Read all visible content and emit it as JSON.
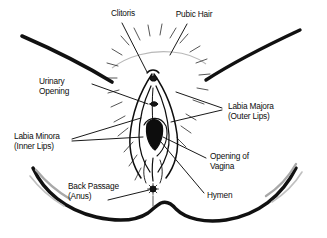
{
  "figure": {
    "kind": "anatomical-line-drawing",
    "style": "black ink line art with stippled pubic hair, white background",
    "ink_color": "#111111",
    "accent_gray": "#9a9a9a",
    "background_color": "#ffffff"
  },
  "labels": {
    "clitoris": {
      "line1": "Clitoris"
    },
    "pubic_hair": {
      "line1": "Pubic Hair"
    },
    "urinary_opening": {
      "line1": "Urinary",
      "line2": "Opening"
    },
    "labia_majora": {
      "line1": "Labia Majora",
      "line2": "(Outer Lips)"
    },
    "labia_minora": {
      "line1": "Labia Minora",
      "line2": "(Inner Lips)"
    },
    "opening_of_vagina": {
      "line1": "Opening of",
      "line2": "Vagina"
    },
    "back_passage": {
      "line1": "Back Passage",
      "line2": "(Anus)"
    },
    "hymen": {
      "line1": "Hymen"
    }
  }
}
